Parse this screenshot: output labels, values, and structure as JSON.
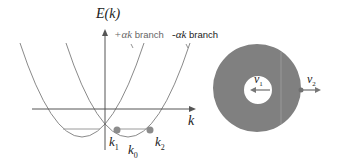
{
  "figure": {
    "left_panel": {
      "y_axis_label": "E(k)",
      "x_axis_label": "k",
      "branches": [
        {
          "name": "plus-alpha-k-branch",
          "label_prefix": "+αk",
          "label_suffix": " branch"
        },
        {
          "name": "minus-alpha-k-branch",
          "label_prefix": "-αk",
          "label_suffix": " branch"
        }
      ],
      "points": [
        {
          "label": "k",
          "sub": "1"
        },
        {
          "label": "k",
          "sub": "0"
        },
        {
          "label": "k",
          "sub": "2"
        }
      ]
    },
    "right_panel": {
      "velocities": [
        {
          "label": "v",
          "sub": "1"
        },
        {
          "label": "v",
          "sub": "2"
        }
      ]
    },
    "colors": {
      "curve": "#8a8a8a",
      "axis": "#555555",
      "marker": "#8c8c8c",
      "ring": "#808080",
      "text": "#222222",
      "branch_text": "#666666"
    }
  }
}
